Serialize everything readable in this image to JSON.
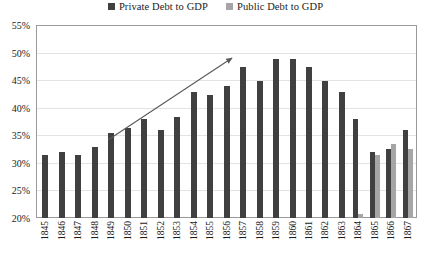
{
  "legend": {
    "position": "top-center",
    "items": [
      {
        "label": "Private Debt to GDP",
        "color": "#404040",
        "icon": "square-marker-icon"
      },
      {
        "label": "Public Debt to GDP",
        "color": "#a6a6a6",
        "icon": "square-marker-icon"
      }
    ]
  },
  "annotations": [
    {
      "name": "upward-trend-arrow",
      "type": "arrow",
      "from": [
        108,
        140
      ],
      "to": [
        232,
        58
      ],
      "color": "#595959"
    }
  ],
  "chart_data": {
    "type": "bar",
    "title": "",
    "subtitle": "",
    "xlabel": "",
    "ylabel": "",
    "ylim": [
      20,
      55
    ],
    "ytick_step": 5,
    "ytick_labels": [
      "20%",
      "25%",
      "30%",
      "35%",
      "40%",
      "45%",
      "50%",
      "55%"
    ],
    "ytick_values": [
      20,
      25,
      30,
      35,
      40,
      45,
      50,
      55
    ],
    "grid": true,
    "grid_axis": "y",
    "legend_position": "top-center",
    "categories": [
      "1845",
      "1846",
      "1847",
      "1848",
      "1849",
      "1850",
      "1851",
      "1852",
      "1853",
      "1854",
      "1855",
      "1856",
      "1857",
      "1858",
      "1859",
      "1860",
      "1861",
      "1862",
      "1863",
      "1864",
      "1865",
      "1866",
      "1867"
    ],
    "series": [
      {
        "name": "Private Debt to GDP",
        "color": "#404040",
        "values": [
          31.5,
          32.0,
          31.5,
          33.0,
          35.5,
          36.5,
          38.0,
          36.0,
          38.5,
          43.0,
          42.5,
          44.0,
          47.5,
          45.0,
          49.0,
          49.0,
          47.5,
          45.0,
          43.0,
          38.0,
          32.0,
          32.5,
          36.0
        ]
      },
      {
        "name": "Public Debt to GDP",
        "color": "#a6a6a6",
        "values": [
          null,
          null,
          null,
          null,
          null,
          null,
          null,
          null,
          null,
          null,
          null,
          null,
          null,
          null,
          null,
          null,
          null,
          null,
          null,
          20.8,
          31.5,
          33.5,
          32.5
        ]
      }
    ]
  }
}
